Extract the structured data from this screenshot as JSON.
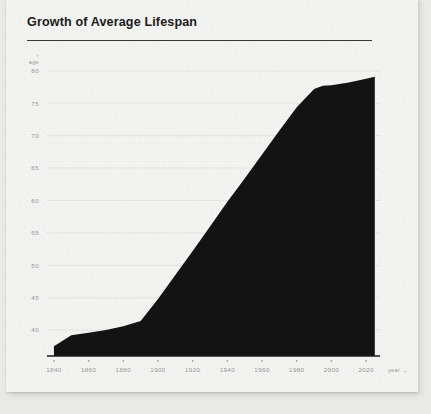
{
  "card": {
    "title": "Growth of Average Lifespan"
  },
  "chart_data": {
    "type": "area",
    "title": "Growth of Average Lifespan",
    "xlabel": "year",
    "ylabel": "age",
    "xlabel_suffix": "→",
    "ylabel_prefix": "↑",
    "grid": true,
    "legend": null,
    "xlim": [
      1836,
      2028
    ],
    "ylim": [
      36,
      82
    ],
    "x_ticks": [
      1840,
      1860,
      1880,
      1900,
      1920,
      1940,
      1960,
      1980,
      2000,
      2020
    ],
    "x_tick_labels": [
      "1840",
      "1860",
      "1880",
      "1900",
      "1920",
      "1940",
      "1960",
      "1980",
      "2000",
      "2020"
    ],
    "y_ticks": [
      40,
      45,
      50,
      55,
      60,
      65,
      70,
      75,
      80
    ],
    "y_tick_labels": [
      "40",
      "45",
      "50",
      "55",
      "60",
      "65",
      "70",
      "75",
      "80"
    ],
    "x": [
      1840,
      1850,
      1860,
      1870,
      1880,
      1890,
      1900,
      1910,
      1920,
      1930,
      1940,
      1950,
      1960,
      1970,
      1980,
      1990,
      1995,
      2000,
      2010,
      2020,
      2025
    ],
    "values": [
      37.5,
      39.2,
      39.6,
      40.0,
      40.6,
      41.4,
      44.8,
      48.5,
      52.2,
      56.0,
      59.8,
      63.4,
      67.1,
      70.8,
      74.4,
      77.2,
      77.7,
      77.8,
      78.2,
      78.8,
      79.1
    ],
    "series": [
      {
        "name": "Average lifespan",
        "values": [
          37.5,
          39.2,
          39.6,
          40.0,
          40.6,
          41.4,
          44.8,
          48.5,
          52.2,
          56.0,
          59.8,
          63.4,
          67.1,
          70.8,
          74.4,
          77.2,
          77.7,
          77.8,
          78.2,
          78.8,
          79.1
        ]
      }
    ],
    "colors": {
      "area_fill": "#131313",
      "axis": "#1b1b1b",
      "grid": "#e2e2de",
      "tick_label": "#9a9a98",
      "title": "#1b1b1b",
      "card_background": "#f7f7f5",
      "page_background": "#ececeb"
    }
  }
}
